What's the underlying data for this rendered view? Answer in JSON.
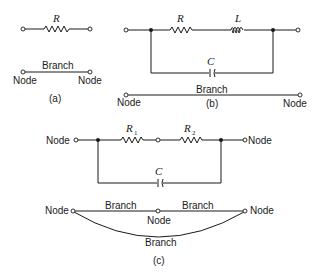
{
  "diagram": {
    "type": "circuit-topology-figure",
    "panels": [
      {
        "id": "a",
        "caption": "(a)",
        "circuit": {
          "components": [
            {
              "type": "resistor",
              "label": "R"
            }
          ]
        },
        "graph": {
          "branch_label": "Branch",
          "node_labels": [
            "Node",
            "Node"
          ]
        }
      },
      {
        "id": "b",
        "caption": "(b)",
        "circuit": {
          "components": [
            {
              "type": "resistor",
              "label": "R"
            },
            {
              "type": "inductor",
              "label": "L"
            },
            {
              "type": "capacitor",
              "label": "C"
            }
          ]
        },
        "graph": {
          "branch_label": "Branch",
          "node_labels": [
            "Node",
            "Node"
          ]
        }
      },
      {
        "id": "c",
        "caption": "(c)",
        "circuit": {
          "node_left": "Node",
          "node_right": "Node",
          "components": [
            {
              "type": "resistor",
              "label": "R",
              "subscript": "1"
            },
            {
              "type": "resistor",
              "label": "R",
              "subscript": "2"
            },
            {
              "type": "capacitor",
              "label": "C"
            }
          ]
        },
        "graph": {
          "branch_labels": [
            "Branch",
            "Branch",
            "Branch"
          ],
          "node_labels": [
            "Node",
            "Node",
            "Node"
          ]
        }
      }
    ]
  }
}
